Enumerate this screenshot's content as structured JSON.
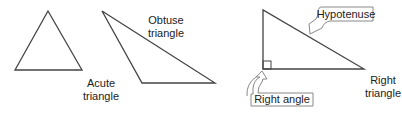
{
  "diagram": {
    "colors": {
      "line": "#444444",
      "text": "#222222",
      "callout_border": "#888888",
      "background": "#ffffff"
    },
    "triangles": [
      {
        "id": "acute",
        "label_line1": "Acute",
        "label_line2": "triangle"
      },
      {
        "id": "obtuse",
        "label_line1": "Obtuse",
        "label_line2": "triangle"
      },
      {
        "id": "right",
        "label_line1": "Right",
        "label_line2": "triangle"
      }
    ],
    "callouts": [
      {
        "id": "hypotenuse",
        "label": "Hypotenuse"
      },
      {
        "id": "right-angle",
        "label": "Right angle"
      }
    ]
  }
}
